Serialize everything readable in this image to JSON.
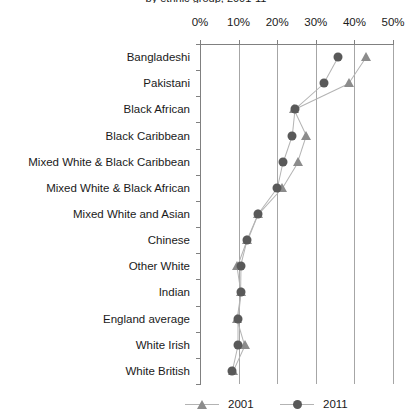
{
  "chart_data": {
    "type": "scatter",
    "title": "by ethnic group, 2001-11",
    "xlabel": "",
    "ylabel": "",
    "xlim": [
      0,
      50
    ],
    "xtick_labels": [
      "0%",
      "10%",
      "20%",
      "30%",
      "40%",
      "50%"
    ],
    "xticks": [
      0,
      10,
      20,
      30,
      40,
      50
    ],
    "grid": true,
    "legend_position": "bottom",
    "categories": [
      "Bangladeshi",
      "Pakistani",
      "Black African",
      "Black Caribbean",
      "Mixed White & Black Caribbean",
      "Mixed White & Black African",
      "Mixed White and Asian",
      "Chinese",
      "Other White",
      "Indian",
      "England average",
      "White Irish",
      "White British"
    ],
    "series": [
      {
        "name": "2001",
        "marker": "triangle",
        "color": "#8c8c8c",
        "values": [
          43.0,
          38.5,
          24.3,
          27.5,
          25.3,
          21.2,
          15.0,
          12.1,
          9.6,
          10.6,
          9.6,
          11.6,
          8.5
        ]
      },
      {
        "name": "2011",
        "marker": "circle",
        "color": "#595959",
        "values": [
          35.8,
          32.1,
          24.5,
          23.8,
          21.5,
          20.0,
          15.0,
          12.3,
          10.6,
          10.5,
          9.8,
          9.8,
          8.3
        ]
      }
    ]
  },
  "legend": {
    "items": [
      {
        "label": "2001",
        "marker": "triangle-marker-icon"
      },
      {
        "label": "2011",
        "marker": "circle-marker-icon"
      }
    ]
  }
}
